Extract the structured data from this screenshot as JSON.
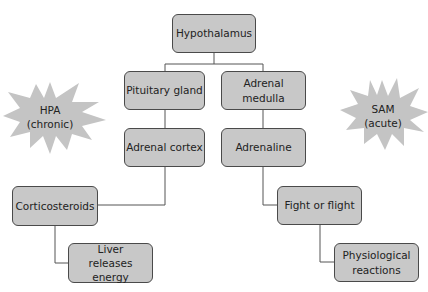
{
  "diagram": {
    "boxes": {
      "hypothalamus": "Hypothalamus",
      "pituitary_gland": "Pituitary gland",
      "adrenal_medulla": "Adrenal medulla",
      "adrenal_cortex": "Adrenal cortex",
      "adrenaline": "Adrenaline",
      "corticosteroids": "Corticosteroids",
      "liver_releases_energy": "Liver releases energy",
      "fight_or_flight": "Fight or flight",
      "physiological_reactions": "Physiological reactions"
    },
    "stars": {
      "hpa": {
        "line1": "HPA",
        "line2": "(chronic)"
      },
      "sam": {
        "line1": "SAM",
        "line2": "(acute)"
      }
    },
    "colors": {
      "box_fill": "#c8c8c8",
      "box_border": "#4a4a4a",
      "star_fill": "#c4c4c4",
      "line": "#555555"
    }
  }
}
